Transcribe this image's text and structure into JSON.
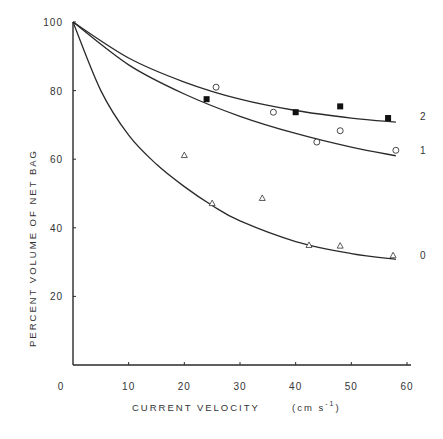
{
  "chart_data": {
    "type": "scatter",
    "title": "",
    "xlabel": "CURRENT VELOCITY",
    "xunit": "(cm s-1)",
    "ylabel": "PERCENT VOLUME OF NET BAG",
    "xlim": [
      0,
      60
    ],
    "ylim": [
      0,
      100
    ],
    "x_ticks": [
      0,
      10,
      20,
      30,
      40,
      50,
      60
    ],
    "y_ticks": [
      20,
      40,
      60,
      80,
      100
    ],
    "grid": false,
    "legend": "curve labels at right end (0, 1, 2)",
    "series": [
      {
        "name": "2",
        "marker": "filled-square",
        "points": [
          [
            24,
            77.5
          ],
          [
            40,
            73.7
          ],
          [
            48,
            75.4
          ],
          [
            56.6,
            72
          ]
        ],
        "fit_curve": [
          [
            0,
            100
          ],
          [
            10,
            89.5
          ],
          [
            20,
            82.5
          ],
          [
            30,
            77.5
          ],
          [
            40,
            74.2
          ],
          [
            50,
            72
          ],
          [
            58,
            70.8
          ]
        ]
      },
      {
        "name": "1",
        "marker": "open-circle",
        "points": [
          [
            25.7,
            81
          ],
          [
            36,
            73.7
          ],
          [
            43.8,
            65
          ],
          [
            48,
            68.3
          ],
          [
            58,
            62.6
          ]
        ],
        "fit_curve": [
          [
            0,
            100
          ],
          [
            10,
            87.5
          ],
          [
            20,
            79
          ],
          [
            30,
            72.5
          ],
          [
            40,
            67.5
          ],
          [
            50,
            63.5
          ],
          [
            58,
            61
          ]
        ]
      },
      {
        "name": "0",
        "marker": "open-triangle",
        "points": [
          [
            20,
            61.2
          ],
          [
            25,
            47.2
          ],
          [
            34,
            48.7
          ],
          [
            42.4,
            35
          ],
          [
            48,
            34.8
          ],
          [
            57.5,
            32
          ]
        ],
        "fit_curve": [
          [
            0,
            100
          ],
          [
            5,
            80
          ],
          [
            10,
            67
          ],
          [
            15,
            58.5
          ],
          [
            20,
            52
          ],
          [
            25,
            46.5
          ],
          [
            30,
            42
          ],
          [
            40,
            36
          ],
          [
            50,
            32.5
          ],
          [
            58,
            30.8
          ]
        ]
      }
    ]
  },
  "labels": {
    "y_axis": "PERCENT VOLUME OF NET BAG",
    "x_axis": "CURRENT VELOCITY",
    "x_unit_prefix": "(cm s",
    "x_unit_exp": "-1",
    "x_unit_suffix": ")",
    "series_0": "0",
    "series_1": "1",
    "series_2": "2"
  }
}
